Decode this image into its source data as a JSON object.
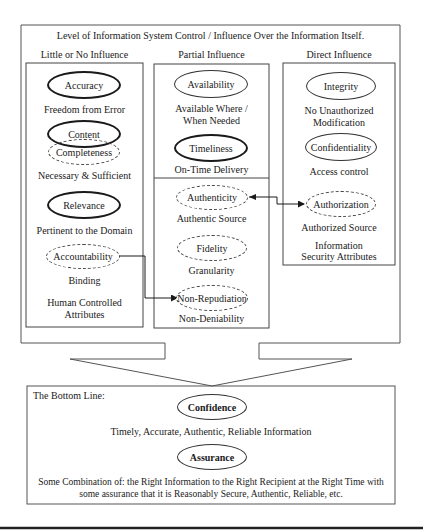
{
  "title": "Level of Information System Control / Influence Over the Information Itself.",
  "columns": [
    {
      "heading": "Little or No Influence",
      "items": [
        {
          "name": "Accuracy",
          "style": "solid-thick",
          "caption": "Freedom from Error"
        },
        {
          "name": "Content",
          "style": "solid-thick",
          "caption": ""
        },
        {
          "name": "Completeness",
          "style": "dashed",
          "caption": "Necessary & Sufficient"
        },
        {
          "name": "Relevance",
          "style": "solid-thick",
          "caption": "Pertinent to the Domain"
        },
        {
          "name": "Accountability",
          "style": "dashed",
          "caption": "Binding"
        }
      ],
      "footer_line1": "Human Controlled",
      "footer_line2": "Attributes"
    },
    {
      "heading": "Partial Influence",
      "items": [
        {
          "name": "Availability",
          "style": "solid-thin",
          "caption_line1": "Available Where /",
          "caption_line2": "When Needed"
        },
        {
          "name": "Timeliness",
          "style": "solid-thick",
          "caption": "On-Time Delivery"
        },
        {
          "name": "Authenticity",
          "style": "dashed",
          "caption": "Authentic Source"
        },
        {
          "name": "Fidelity",
          "style": "dashed",
          "caption": "Granularity"
        },
        {
          "name": "Non-Repudiation",
          "style": "dashed",
          "caption": "Non-Deniability"
        }
      ]
    },
    {
      "heading": "Direct Influence",
      "items": [
        {
          "name": "Integrity",
          "style": "solid-thin",
          "caption_line1": "No Unauthorized",
          "caption_line2": "Modification"
        },
        {
          "name": "Confidentiality",
          "style": "solid-thin",
          "caption": "Access control"
        },
        {
          "name": "Authorization",
          "style": "dashed",
          "caption": "Authorized Source"
        }
      ],
      "footer_line1": "Information",
      "footer_line2": "Security Attributes"
    }
  ],
  "connectors": [
    {
      "from": "Accountability",
      "to": "Non-Repudiation",
      "type": "bidirectional"
    },
    {
      "from": "Authenticity",
      "to": "Authorization",
      "type": "bidirectional"
    }
  ],
  "bottom_line": {
    "label": "The Bottom Line:",
    "confidence": "Confidence",
    "confidence_caption": "Timely, Accurate, Authentic, Reliable Information",
    "assurance": "Assurance",
    "assurance_caption_line1": "Some Combination of: the Right Information to the Right Recipient at the Right Time with",
    "assurance_caption_line2": "some assurance that it is Reasonably Secure, Authentic, Reliable, etc."
  }
}
